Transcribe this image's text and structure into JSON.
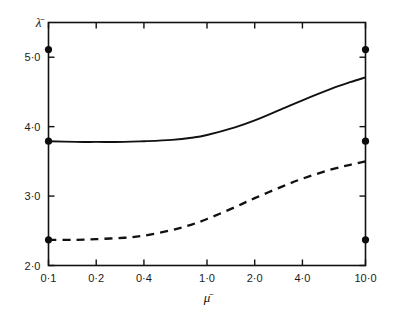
{
  "chart_data": {
    "type": "line",
    "title": "",
    "xlabel": "μ̄",
    "ylabel": "λ̄",
    "xscale": "log",
    "xlim": [
      0.1,
      10.0
    ],
    "ylim": [
      2.0,
      5.5
    ],
    "grid": false,
    "legend": "none",
    "x_tick_labels": [
      "0·1",
      "0·2",
      "0·4",
      "1·0",
      "2·0",
      "4·0",
      "10·0"
    ],
    "x_tick_values": [
      0.1,
      0.2,
      0.4,
      1.0,
      2.0,
      4.0,
      10.0
    ],
    "y_tick_labels": [
      "5·0",
      "4·0",
      "3·0",
      "2·0"
    ],
    "y_tick_values": [
      5.0,
      4.0,
      3.0,
      2.0
    ],
    "series": [
      {
        "name": "solid-curve",
        "style": "solid",
        "color": "#111111",
        "x": [
          0.1,
          0.15,
          0.2,
          0.3,
          0.4,
          0.6,
          0.8,
          1.0,
          1.5,
          2.0,
          3.0,
          4.0,
          6.0,
          8.0,
          10.0
        ],
        "values": [
          3.79,
          3.78,
          3.78,
          3.78,
          3.79,
          3.81,
          3.84,
          3.88,
          3.99,
          4.09,
          4.26,
          4.38,
          4.54,
          4.64,
          4.71
        ]
      },
      {
        "name": "dashed-curve",
        "style": "dashed",
        "color": "#111111",
        "x": [
          0.1,
          0.15,
          0.2,
          0.3,
          0.4,
          0.6,
          0.8,
          1.0,
          1.5,
          2.0,
          3.0,
          4.0,
          6.0,
          8.0,
          10.0
        ],
        "values": [
          2.37,
          2.37,
          2.38,
          2.4,
          2.43,
          2.51,
          2.59,
          2.67,
          2.84,
          2.97,
          3.14,
          3.25,
          3.38,
          3.45,
          3.5
        ]
      }
    ],
    "markers": [
      {
        "name": "left-upper-point",
        "x": 0.1,
        "y": 5.11
      },
      {
        "name": "left-middle-point",
        "x": 0.1,
        "y": 3.79
      },
      {
        "name": "left-lower-point",
        "x": 0.1,
        "y": 2.37
      },
      {
        "name": "right-upper-point",
        "x": 10.0,
        "y": 5.11
      },
      {
        "name": "right-middle-point",
        "x": 10.0,
        "y": 3.79
      },
      {
        "name": "right-lower-point",
        "x": 10.0,
        "y": 2.37
      }
    ]
  }
}
